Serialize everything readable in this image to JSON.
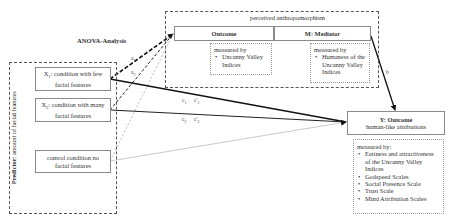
{
  "anova_label": "ANOVA-Analysis",
  "anthropomorphism": {
    "title": "perceived anthropomorphism",
    "outcome": {
      "title": "Outcome",
      "measured_by": "measured by",
      "items": [
        "Uncanny Valley Indices"
      ]
    },
    "mediator": {
      "title": "M: Mediator",
      "measured_by": "measured by",
      "items": [
        "Humaness of the Uncanny Valley Indices"
      ]
    }
  },
  "predictor": {
    "label_bold": "Predictor",
    "label_rest": ": amount of facial features",
    "conditions": [
      {
        "symbol": "X",
        "sub": "1",
        "text": ": condition with few facial features"
      },
      {
        "symbol": "X",
        "sub": "2",
        "text": ": condition with many facial features"
      },
      {
        "symbol": "",
        "sub": "",
        "text": "control condition no facial features"
      }
    ]
  },
  "y_outcome": {
    "title": "Y: Outcome",
    "subtitle": "human-like attributions",
    "measured_by": "measured by:",
    "items": [
      "Eeriness and attractiveness of the Uncanny Valley Indices",
      "Godspeed Scales",
      "Social Presence Scale",
      "Trust Scale",
      "Mind Attribution Scales"
    ]
  },
  "paths": {
    "a1": {
      "letter": "a",
      "sub": "1"
    },
    "a2": {
      "letter": "a",
      "sub": "2"
    },
    "b": {
      "letter": "b",
      "sub": ""
    },
    "c1": {
      "letter": "c",
      "sub": "1"
    },
    "c1p": {
      "letter": "c'",
      "sub": "1"
    },
    "c2": {
      "letter": "c",
      "sub": "2"
    },
    "c2p": {
      "letter": "c'",
      "sub": "2"
    }
  }
}
